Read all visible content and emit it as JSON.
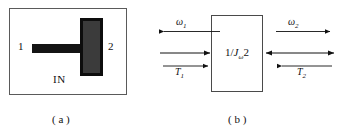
{
  "figure": {
    "width": 341,
    "height": 135,
    "background": "#ffffff",
    "line_color": "#111111"
  },
  "part_a": {
    "caption": "( a )",
    "frame_name": "enclosure-rectangle",
    "port_left_label": "1",
    "port_right_label": "2",
    "inside_label": "IN",
    "shaft_name": "shaft-bar",
    "shaft_color": "#141414",
    "flywheel_name": "inertia-disc",
    "flywheel_fill": "#3b3b3b",
    "flywheel_stroke": "#0d0d0d"
  },
  "part_b": {
    "caption": "( b )",
    "block": {
      "prefix": "1/",
      "symbol": "J",
      "subscript": "ω",
      "suffix": "2"
    },
    "left_port": {
      "effort_label": "T",
      "effort_subscript": "1",
      "flow_label": "ω",
      "flow_subscript": "1",
      "flow_arrow_direction": "left",
      "effort_arrow_direction": "right",
      "bond_arrow_direction": "right"
    },
    "right_port": {
      "effort_label": "T",
      "effort_subscript": "2",
      "flow_label": "ω",
      "flow_subscript": "2",
      "flow_arrow_direction": "right",
      "effort_arrow_direction": "left",
      "bond_arrow_direction": "both"
    }
  }
}
